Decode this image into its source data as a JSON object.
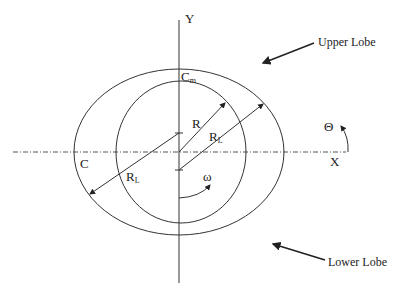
{
  "diagram": {
    "axes": {
      "y_label": "Y",
      "x_label": "X"
    },
    "labels": {
      "cm_main": "C",
      "cm_sub": "m",
      "c_left": "C",
      "r": "R",
      "rl_right_main": "R",
      "rl_right_sub": "L",
      "rl_left_main": "R",
      "rl_left_sub": "L",
      "omega": "ω",
      "theta": "Θ"
    },
    "annotations": {
      "upper_lobe": "Upper Lobe",
      "lower_lobe": "Lower Lobe"
    },
    "colors": {
      "stroke": "#333333",
      "text": "#222222"
    }
  }
}
